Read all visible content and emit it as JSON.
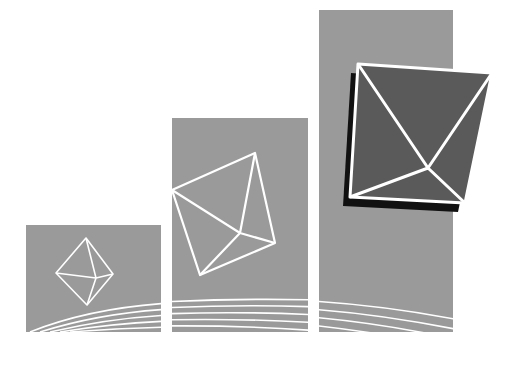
{
  "illustration": {
    "description": "Three ascending gray panels with wireframe octahedra growing in size, with curved white lines at the bottom",
    "colors": {
      "background": "#ffffff",
      "panel": "#9a9a9a",
      "dark_face": "#5a5a5a",
      "shadow": "#111111",
      "lines": "#ffffff"
    },
    "panels": [
      {
        "name": "small",
        "x": 26,
        "y": 225,
        "w": 135,
        "h": 107
      },
      {
        "name": "medium",
        "x": 172,
        "y": 118,
        "w": 136,
        "h": 214
      },
      {
        "name": "large",
        "x": 319,
        "y": 10,
        "w": 134,
        "h": 322
      }
    ]
  }
}
